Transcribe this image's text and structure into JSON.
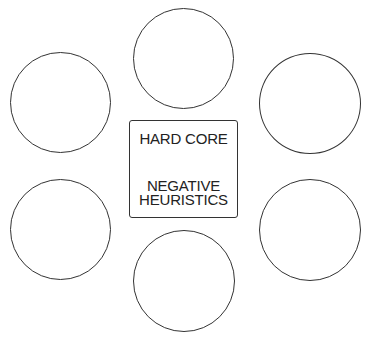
{
  "diagram": {
    "core": {
      "title": "HARD CORE",
      "subtitle_lines": [
        "NEGATIVE",
        "HEURISTICS"
      ]
    },
    "circles": [
      {
        "id": "top",
        "label": ""
      },
      {
        "id": "top-left",
        "label": ""
      },
      {
        "id": "top-right",
        "label": ""
      },
      {
        "id": "bottom-left",
        "label": ""
      },
      {
        "id": "bottom-right",
        "label": ""
      },
      {
        "id": "bottom",
        "label": ""
      }
    ],
    "colors": {
      "stroke": "#333333",
      "text": "#222222",
      "background": "#ffffff"
    }
  }
}
